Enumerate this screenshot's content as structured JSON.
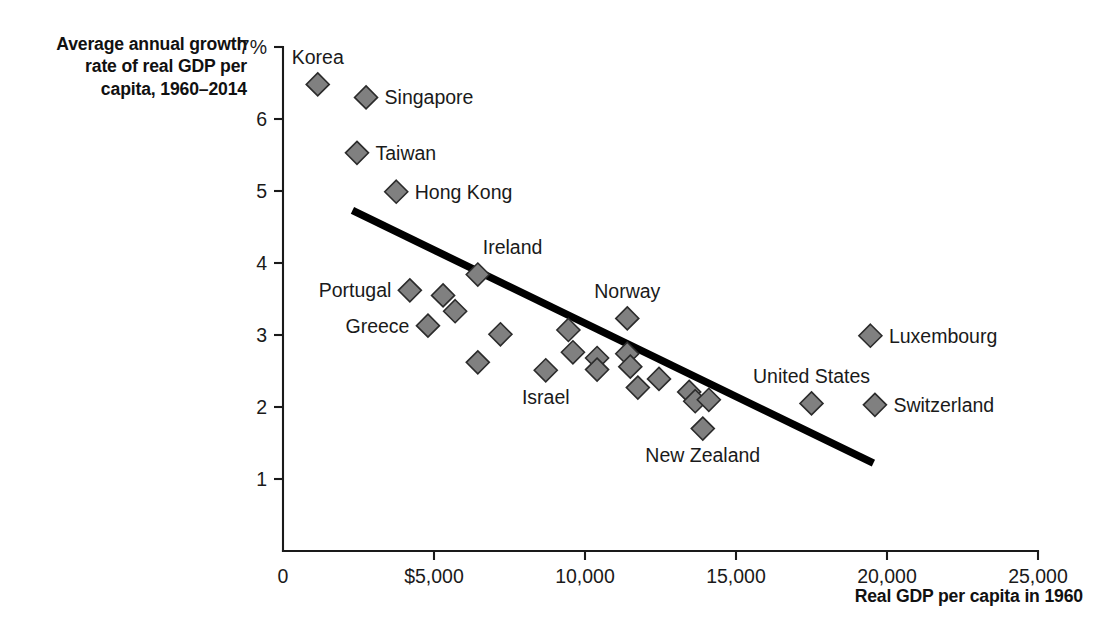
{
  "title": {
    "line1": "Average annual growth",
    "line2": "rate of real GDP per",
    "line3": "capita, 1960–2014"
  },
  "axis_title_x": "Real GDP per capita in 1960",
  "colors": {
    "marker_fill": "#808080",
    "marker_stroke": "#2b2b2b",
    "trend_line": "#000000",
    "axis": "#1a1a1a",
    "background": "#ffffff"
  },
  "chart_data": {
    "type": "scatter",
    "title": "Average annual growth rate of real GDP per capita, 1960–2014",
    "xlabel": "Real GDP per capita in 1960",
    "ylabel": "Average annual growth rate of real GDP per capita, 1960–2014",
    "xlim": [
      0,
      25000
    ],
    "ylim": [
      0,
      7
    ],
    "grid": false,
    "legend": "none",
    "xticks": [
      0,
      5000,
      10000,
      15000,
      20000,
      25000
    ],
    "xticklabels": [
      "0",
      "$5,000",
      "10,000",
      "15,000",
      "20,000",
      "25,000"
    ],
    "yticks": [
      1,
      2,
      3,
      4,
      5,
      6,
      7
    ],
    "yticklabels": [
      "1",
      "2",
      "3",
      "4",
      "5",
      "6",
      "7%"
    ],
    "points": [
      {
        "label": "Korea",
        "x": 1150,
        "y": 6.48,
        "label_pos": "above"
      },
      {
        "label": "Singapore",
        "x": 2750,
        "y": 6.3,
        "label_pos": "right"
      },
      {
        "label": "Taiwan",
        "x": 2450,
        "y": 5.53,
        "label_pos": "right"
      },
      {
        "label": "Hong Kong",
        "x": 3750,
        "y": 4.99,
        "label_pos": "right"
      },
      {
        "label": "Ireland",
        "x": 6450,
        "y": 3.84,
        "label_pos": "above-right"
      },
      {
        "label": "Portugal",
        "x": 4200,
        "y": 3.62,
        "label_pos": "left"
      },
      {
        "label": "",
        "x": 5300,
        "y": 3.55,
        "label_pos": "none"
      },
      {
        "label": "",
        "x": 5700,
        "y": 3.33,
        "label_pos": "none"
      },
      {
        "label": "Greece",
        "x": 4800,
        "y": 3.13,
        "label_pos": "left"
      },
      {
        "label": "",
        "x": 7200,
        "y": 3.01,
        "label_pos": "none"
      },
      {
        "label": "",
        "x": 6450,
        "y": 2.62,
        "label_pos": "none"
      },
      {
        "label": "Norway",
        "x": 11400,
        "y": 3.23,
        "label_pos": "above"
      },
      {
        "label": "",
        "x": 9450,
        "y": 3.07,
        "label_pos": "none"
      },
      {
        "label": "",
        "x": 9600,
        "y": 2.76,
        "label_pos": "none"
      },
      {
        "label": "Israel",
        "x": 8700,
        "y": 2.51,
        "label_pos": "below"
      },
      {
        "label": "",
        "x": 10400,
        "y": 2.68,
        "label_pos": "none"
      },
      {
        "label": "",
        "x": 10400,
        "y": 2.52,
        "label_pos": "none"
      },
      {
        "label": "",
        "x": 11400,
        "y": 2.74,
        "label_pos": "none"
      },
      {
        "label": "",
        "x": 11500,
        "y": 2.56,
        "label_pos": "none"
      },
      {
        "label": "",
        "x": 12450,
        "y": 2.39,
        "label_pos": "none"
      },
      {
        "label": "",
        "x": 11750,
        "y": 2.27,
        "label_pos": "none"
      },
      {
        "label": "",
        "x": 13450,
        "y": 2.21,
        "label_pos": "none"
      },
      {
        "label": "",
        "x": 13650,
        "y": 2.08,
        "label_pos": "none"
      },
      {
        "label": "",
        "x": 14100,
        "y": 2.1,
        "label_pos": "none"
      },
      {
        "label": "New Zealand",
        "x": 13900,
        "y": 1.7,
        "label_pos": "below"
      },
      {
        "label": "Luxembourg",
        "x": 19450,
        "y": 2.99,
        "label_pos": "right"
      },
      {
        "label": "United States",
        "x": 17500,
        "y": 2.05,
        "label_pos": "above"
      },
      {
        "label": "Switzerland",
        "x": 19600,
        "y": 2.03,
        "label_pos": "right"
      }
    ],
    "trend_line": {
      "x_start": 2300,
      "y_start": 4.73,
      "x_end": 19550,
      "y_end": 1.22
    }
  }
}
